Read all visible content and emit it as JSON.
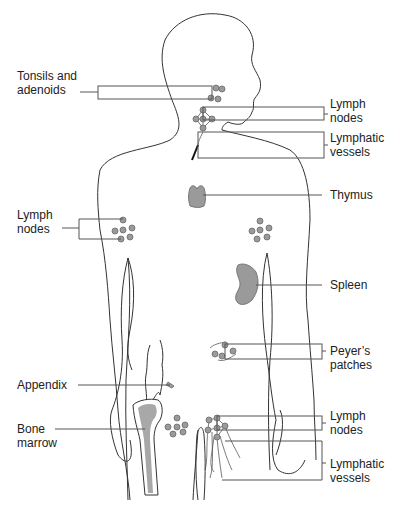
{
  "diagram": {
    "title": "",
    "colors": {
      "organ_fill": "#9a9a9a",
      "outline": "#333333",
      "background": "#ffffff"
    },
    "labels": {
      "tonsils": "Tonsils and adenoids",
      "tonsils_line1": "Tonsils and",
      "tonsils_line2": "adenoids",
      "neck_nodes_line1": "Lymph",
      "neck_nodes_line2": "nodes",
      "neck_vessels_line1": "Lymphatic",
      "neck_vessels_line2": "vessels",
      "thymus": "Thymus",
      "axillary_nodes_line1": "Lymph",
      "axillary_nodes_line2": "nodes",
      "spleen": "Spleen",
      "peyers_line1": "Peyer’s",
      "peyers_line2": "patches",
      "appendix": "Appendix",
      "bone_line1": "Bone",
      "bone_line2": "marrow",
      "groin_nodes_line1": "Lymph",
      "groin_nodes_line2": "nodes",
      "groin_vessels_line1": "Lymphatic",
      "groin_vessels_line2": "vessels"
    }
  }
}
